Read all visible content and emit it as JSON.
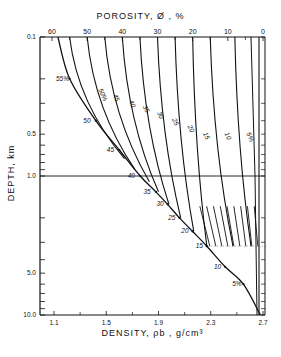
{
  "chart_data": {
    "type": "line",
    "xlabel": "DENSITY, ρb, g/cm³",
    "ylabel": "DEPTH, km",
    "x_axis": {
      "min": 1.0,
      "max": 2.7,
      "ticks": [
        1.1,
        1.5,
        1.9,
        2.3,
        2.7
      ],
      "tick_labels": [
        "1.1",
        "1.5",
        "1.9",
        "2.3",
        "2.7"
      ]
    },
    "top_axis": {
      "label": "POROSITY",
      "ticks": [
        60,
        50,
        40,
        30,
        20,
        10,
        0
      ],
      "tick_labels": [
        "60",
        "50",
        "40",
        "30",
        "20",
        "10",
        "0"
      ]
    },
    "y_axis": {
      "scale": "log",
      "min": 0.1,
      "max": 10.0,
      "inverted": true,
      "tick_labels": [
        "0.1",
        "0.5",
        "1.0",
        "5.0",
        "10.0"
      ]
    },
    "reference_line": {
      "depth_km": 1.0
    },
    "compaction_curve": {
      "name": "normal compaction",
      "points": [
        {
          "depth": 0.1,
          "density": 1.13,
          "porosity": 58
        },
        {
          "depth": 0.2,
          "density": 1.22,
          "porosity": 55
        },
        {
          "depth": 0.4,
          "density": 1.42,
          "porosity": 50
        },
        {
          "depth": 0.65,
          "density": 1.6,
          "porosity": 45
        },
        {
          "depth": 1.0,
          "density": 1.76,
          "porosity": 40
        },
        {
          "depth": 1.3,
          "density": 1.88,
          "porosity": 35
        },
        {
          "depth": 1.6,
          "density": 1.97,
          "porosity": 30
        },
        {
          "depth": 2.0,
          "density": 2.06,
          "porosity": 25
        },
        {
          "depth": 2.5,
          "density": 2.16,
          "porosity": 20
        },
        {
          "depth": 3.2,
          "density": 2.27,
          "porosity": 15
        },
        {
          "depth": 4.5,
          "density": 2.41,
          "porosity": 10
        },
        {
          "depth": 6.0,
          "density": 2.55,
          "porosity": 5
        },
        {
          "depth": 10.0,
          "density": 2.68,
          "porosity": 0
        }
      ],
      "labels": [
        "55%",
        "50",
        "45",
        "40",
        "35",
        "30",
        "25",
        "20",
        "15",
        "10",
        "5%"
      ]
    },
    "series": [
      {
        "name": "50%",
        "label": "50%"
      },
      {
        "name": "45",
        "label": "45"
      },
      {
        "name": "40",
        "label": "40"
      },
      {
        "name": "35",
        "label": "35"
      },
      {
        "name": "30",
        "label": "30"
      },
      {
        "name": "25",
        "label": "25"
      },
      {
        "name": "20",
        "label": "20"
      },
      {
        "name": "15",
        "label": "15"
      },
      {
        "name": "10",
        "label": "10"
      },
      {
        "name": "5%",
        "label": "5%"
      }
    ],
    "grid": false
  },
  "labels": {
    "title": "POROSITY,  Ø , %",
    "xtitle": "DENSITY,  ρb , g/cm³",
    "ytitle": "DEPTH, km"
  }
}
